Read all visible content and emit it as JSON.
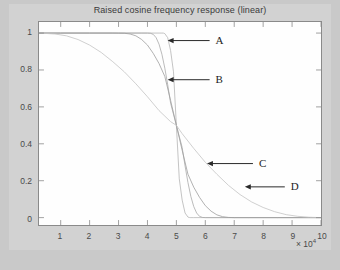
{
  "figure": {
    "title": "Raised cosine frequency response (linear)",
    "background_color": "#d2d2d2",
    "axes_background_color": "#fefefe",
    "axes_border_color": "#8a8a8a"
  },
  "axis": {
    "x_exponent_prefix": "× 10",
    "x_exponent_power": "4",
    "x_tick_labels": [
      "1",
      "2",
      "3",
      "4",
      "5",
      "6",
      "7",
      "8",
      "9",
      "10"
    ],
    "y_tick_labels": [
      "1",
      "0.8",
      "0.6",
      "0.4",
      "0.2",
      "0"
    ]
  },
  "annotations": [
    {
      "label": "A",
      "target_x": 47000,
      "target_y": 0.955
    },
    {
      "label": "B",
      "target_x": 47000,
      "target_y": 0.745
    },
    {
      "label": "C",
      "target_x": 60500,
      "target_y": 0.295
    },
    {
      "label": "D",
      "target_x": 73500,
      "target_y": 0.17
    }
  ],
  "chart_data": {
    "type": "line",
    "title": "Raised cosine frequency response (linear)",
    "xlabel": "",
    "ylabel": "",
    "xlim": [
      2500,
      100000
    ],
    "ylim": [
      -0.04,
      1.06
    ],
    "x_exponent": 4,
    "grid": false,
    "legend": "none",
    "x_unit_scale": 10000,
    "series": [
      {
        "name": "A",
        "rolloff": 0.1,
        "color": "#b4b4b4",
        "x": [
          2500,
          10000,
          20000,
          30000,
          40000,
          44000,
          45000,
          45500,
          46000,
          47000,
          48000,
          49000,
          50000,
          51000,
          52000,
          53000,
          54000,
          54500,
          55000,
          56000,
          60000,
          70000,
          80000,
          90000,
          100000
        ],
        "y": [
          1,
          1,
          1,
          1,
          1,
          1,
          1,
          1,
          0.997,
          0.975,
          0.905,
          0.79,
          0.5,
          0.21,
          0.095,
          0.025,
          0.003,
          0.0005,
          0,
          0,
          0,
          0,
          0,
          0,
          0
        ]
      },
      {
        "name": "B",
        "rolloff": 0.2,
        "color": "#a9a9a9",
        "x": [
          2500,
          10000,
          20000,
          30000,
          38000,
          40000,
          41000,
          42000,
          43000,
          44000,
          45000,
          46000,
          47000,
          48000,
          50000,
          52000,
          53000,
          54000,
          55000,
          56000,
          57000,
          58000,
          59000,
          60000,
          62000,
          70000,
          85000,
          100000
        ],
        "y": [
          1,
          1,
          1,
          1,
          1,
          1,
          0.999,
          0.993,
          0.975,
          0.94,
          0.885,
          0.81,
          0.72,
          0.62,
          0.5,
          0.38,
          0.28,
          0.19,
          0.115,
          0.06,
          0.025,
          0.007,
          0.001,
          0,
          0,
          0,
          0,
          0
        ]
      },
      {
        "name": "C",
        "rolloff": 0.35,
        "color": "#9e9e9e",
        "x": [
          2500,
          10000,
          20000,
          28000,
          32000,
          34000,
          36000,
          38000,
          40000,
          42000,
          44000,
          46000,
          48000,
          50000,
          52000,
          54000,
          56000,
          58000,
          60000,
          62000,
          64000,
          66000,
          68000,
          70000,
          75000,
          85000,
          100000
        ],
        "y": [
          1,
          1,
          1,
          1,
          0.999,
          0.995,
          0.985,
          0.965,
          0.935,
          0.89,
          0.835,
          0.765,
          0.635,
          0.5,
          0.365,
          0.235,
          0.165,
          0.11,
          0.065,
          0.035,
          0.015,
          0.005,
          0.001,
          0,
          0,
          0,
          0
        ]
      },
      {
        "name": "D",
        "rolloff": 0.75,
        "color": "#c4c4c4",
        "x": [
          2500,
          8000,
          12000,
          16000,
          20000,
          24000,
          28000,
          32000,
          36000,
          40000,
          44000,
          48000,
          50000,
          52000,
          56000,
          60000,
          64000,
          68000,
          72000,
          76000,
          80000,
          84000,
          88000,
          92000,
          96000,
          100000
        ],
        "y": [
          1,
          0.995,
          0.985,
          0.965,
          0.935,
          0.895,
          0.845,
          0.79,
          0.725,
          0.655,
          0.58,
          0.52,
          0.5,
          0.455,
          0.375,
          0.3,
          0.235,
          0.175,
          0.125,
          0.085,
          0.055,
          0.032,
          0.016,
          0.007,
          0.002,
          0
        ]
      }
    ]
  }
}
